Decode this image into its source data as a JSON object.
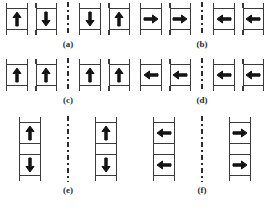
{
  "figure": {
    "type": "schematic-diagram",
    "background_color": "#ffffff",
    "line_color": "#3a3a3a",
    "arrow_color": "#141414",
    "divider_style": "dash-dot-vertical",
    "divider_meaning": "interface-or-domain-wall",
    "cell_shape": "square-with-terminal-ticks",
    "panel_count": 6
  },
  "panels": [
    {
      "id": "a",
      "caption": "(a)",
      "layout": "row",
      "left_group": [
        {
          "name": "cell-a-1",
          "direction": "up",
          "glyph": "arrow-up-icon"
        },
        {
          "name": "cell-a-2",
          "direction": "down",
          "glyph": "arrow-down-icon"
        }
      ],
      "right_group": [
        {
          "name": "cell-a-3",
          "direction": "down",
          "glyph": "arrow-down-icon"
        },
        {
          "name": "cell-a-4",
          "direction": "up",
          "glyph": "arrow-up-icon"
        }
      ]
    },
    {
      "id": "b",
      "caption": "(b)",
      "layout": "row",
      "left_group": [
        {
          "name": "cell-b-1",
          "direction": "right",
          "glyph": "arrow-right-icon"
        },
        {
          "name": "cell-b-2",
          "direction": "right",
          "glyph": "arrow-right-icon"
        }
      ],
      "right_group": [
        {
          "name": "cell-b-3",
          "direction": "left",
          "glyph": "arrow-left-icon"
        },
        {
          "name": "cell-b-4",
          "direction": "left",
          "glyph": "arrow-left-icon"
        }
      ]
    },
    {
      "id": "c",
      "caption": "(c)",
      "layout": "row",
      "left_group": [
        {
          "name": "cell-c-1",
          "direction": "up",
          "glyph": "arrow-up-icon"
        },
        {
          "name": "cell-c-2",
          "direction": "up",
          "glyph": "arrow-up-icon"
        }
      ],
      "right_group": [
        {
          "name": "cell-c-3",
          "direction": "up",
          "glyph": "arrow-up-icon"
        },
        {
          "name": "cell-c-4",
          "direction": "up",
          "glyph": "arrow-up-icon"
        }
      ]
    },
    {
      "id": "d",
      "caption": "(d)",
      "layout": "row",
      "left_group": [
        {
          "name": "cell-d-1",
          "direction": "left",
          "glyph": "arrow-left-icon"
        },
        {
          "name": "cell-d-2",
          "direction": "left",
          "glyph": "arrow-left-icon"
        }
      ],
      "right_group": [
        {
          "name": "cell-d-3",
          "direction": "left",
          "glyph": "arrow-left-icon"
        },
        {
          "name": "cell-d-4",
          "direction": "left",
          "glyph": "arrow-left-icon"
        }
      ]
    },
    {
      "id": "e",
      "caption": "(e)",
      "layout": "grid",
      "left_group": [
        {
          "name": "cell-e-1",
          "direction": "up",
          "glyph": "arrow-up-icon"
        },
        {
          "name": "cell-e-3",
          "direction": "down",
          "glyph": "arrow-down-icon"
        }
      ],
      "right_group": [
        {
          "name": "cell-e-2",
          "direction": "up",
          "glyph": "arrow-up-icon"
        },
        {
          "name": "cell-e-4",
          "direction": "down",
          "glyph": "arrow-down-icon"
        }
      ]
    },
    {
      "id": "f",
      "caption": "(f)",
      "layout": "grid",
      "left_group": [
        {
          "name": "cell-f-1",
          "direction": "left",
          "glyph": "arrow-left-icon"
        },
        {
          "name": "cell-f-3",
          "direction": "left",
          "glyph": "arrow-left-icon"
        }
      ],
      "right_group": [
        {
          "name": "cell-f-2",
          "direction": "right",
          "glyph": "arrow-right-icon"
        },
        {
          "name": "cell-f-4",
          "direction": "right",
          "glyph": "arrow-right-icon"
        }
      ]
    }
  ]
}
